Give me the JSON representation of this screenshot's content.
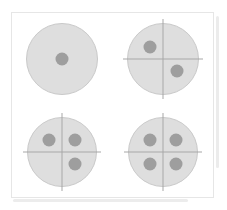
{
  "figure": {
    "background_color": "#ffffff",
    "frame_color": "#e6e6e6",
    "fold_line_color": "#ececec",
    "disc_fill_color": "#dedede",
    "disc_stroke_color": "#c9c9c9",
    "cross_line_color": "#a8a8a8",
    "dot_color": "#9e9e9e"
  },
  "cells": [
    {
      "id": "cell-1",
      "position": "top-left",
      "dot_count": 1,
      "has_crosshair": false,
      "dots": [
        "center"
      ]
    },
    {
      "id": "cell-2",
      "position": "top-right",
      "dot_count": 2,
      "has_crosshair": true,
      "dots": [
        "upper-left",
        "lower-right"
      ]
    },
    {
      "id": "cell-3",
      "position": "bottom-left",
      "dot_count": 3,
      "has_crosshair": true,
      "dots": [
        "upper-left",
        "upper-right",
        "lower-right"
      ]
    },
    {
      "id": "cell-4",
      "position": "bottom-right",
      "dot_count": 4,
      "has_crosshair": true,
      "dots": [
        "upper-left",
        "upper-right",
        "lower-left",
        "lower-right"
      ]
    }
  ]
}
